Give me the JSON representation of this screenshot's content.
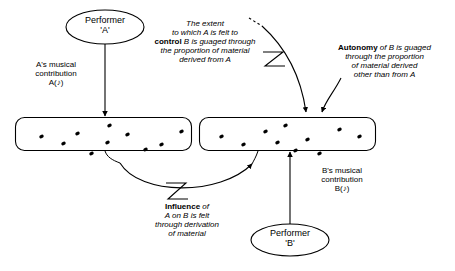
{
  "diagram": {
    "title_caption": "",
    "nodes": {
      "performer_a": {
        "line1": "Performer",
        "line2": "'A'"
      },
      "performer_b": {
        "line1": "Performer",
        "line2": "'B'"
      }
    },
    "labels": {
      "a_contribution": "A's musical\ncontribution\nA(♪)",
      "b_contribution": "B's musical\ncontribution\nB(♪)",
      "control_text_plain_1": "The extent\nto which A is felt to\n",
      "control_text_bold": "control",
      "control_text_plain_2": " B is guaged through\nthe proportion of material\nderived from A",
      "autonomy_text_bold": "Autonomy",
      "autonomy_text_plain": " of B is guaged\nthrough the proportion\nof material derived\nother than from A",
      "influence_text_bold": "Influence",
      "influence_text_plain": " of\nA on B is felt\nthrough derivation\nof material"
    },
    "boxes": {
      "box_a_name": "material-box-a",
      "box_b_name": "material-box-b",
      "box_a_dots": [
        [
          26,
          19
        ],
        [
          48,
          26
        ],
        [
          62,
          16
        ],
        [
          94,
          8
        ],
        [
          92,
          25
        ],
        [
          112,
          17
        ],
        [
          130,
          32
        ],
        [
          146,
          27
        ],
        [
          166,
          14
        ],
        [
          76,
          36
        ]
      ],
      "box_b_dots": [
        [
          22,
          19
        ],
        [
          44,
          27
        ],
        [
          66,
          14
        ],
        [
          78,
          25
        ],
        [
          86,
          8
        ],
        [
          96,
          33
        ],
        [
          120,
          36
        ],
        [
          140,
          12
        ],
        [
          160,
          19
        ],
        [
          108,
          22
        ]
      ]
    },
    "colors": {
      "stroke": "#000000",
      "dot_fill": "#000000",
      "background": "#ffffff",
      "caption_text": "#3a3a3a"
    }
  }
}
